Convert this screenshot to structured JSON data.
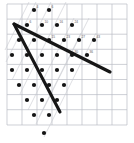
{
  "figure": {
    "width": 134,
    "height": 143,
    "background_color": "#ffffff"
  },
  "chart_data": {
    "type": "scatter",
    "title": "",
    "subtitle": "",
    "xlabel": "",
    "ylabel": "",
    "xlim": [
      0,
      134
    ],
    "ylim": [
      143,
      0
    ],
    "grid": true,
    "legend": false,
    "legend_position": "none",
    "colors": {
      "grid": "#b9bcc4",
      "guide_line": "#c7cad0",
      "ray": "#161616",
      "dot": "#141414",
      "label": "#5a5d63"
    },
    "grid_spec": {
      "x0": 7,
      "y0": 4,
      "x1": 127,
      "y1": 125,
      "cell_width": 15,
      "cell_height": 15.1,
      "vertical_lines": [
        7,
        22,
        37,
        52,
        67,
        82,
        97,
        112,
        127
      ],
      "horizontal_lines": [
        4,
        19.1,
        34.2,
        49.3,
        64.4,
        79.5,
        94.6,
        109.7,
        125
      ]
    },
    "lattice": {
      "basis_u": [
        15.0,
        0.0
      ],
      "basis_v": [
        -7.4,
        15.1
      ],
      "dot_radius": 2.1,
      "note": "Dot rows step left as they descend, producing the sheared arrangement."
    },
    "points": [
      {
        "id": 1,
        "x": 34,
        "y": 10,
        "label": "4"
      },
      {
        "id": 2,
        "x": 49,
        "y": 10,
        "label": "6"
      },
      {
        "id": 3,
        "x": 27,
        "y": 25,
        "label": "6"
      },
      {
        "id": 4,
        "x": 42,
        "y": 25,
        "label": "10"
      },
      {
        "id": 5,
        "x": 57,
        "y": 25,
        "label": "16"
      },
      {
        "id": 6,
        "x": 72,
        "y": 25,
        "label": "24"
      },
      {
        "id": 7,
        "x": 19,
        "y": 40,
        "label": ""
      },
      {
        "id": 8,
        "x": 34,
        "y": 40,
        "label": ""
      },
      {
        "id": 9,
        "x": 49,
        "y": 40,
        "label": "15"
      },
      {
        "id": 10,
        "x": 64,
        "y": 40,
        "label": "23"
      },
      {
        "id": 11,
        "x": 79,
        "y": 40,
        "label": "27"
      },
      {
        "id": 12,
        "x": 94,
        "y": 40,
        "label": "43"
      },
      {
        "id": 13,
        "x": 12,
        "y": 55,
        "label": ""
      },
      {
        "id": 14,
        "x": 27,
        "y": 55,
        "label": ""
      },
      {
        "id": 15,
        "x": 42,
        "y": 55,
        "label": ""
      },
      {
        "id": 16,
        "x": 57,
        "y": 55,
        "label": ""
      },
      {
        "id": 17,
        "x": 72,
        "y": 55,
        "label": "30"
      },
      {
        "id": 18,
        "x": 87,
        "y": 55,
        "label": "36"
      },
      {
        "id": 19,
        "x": 12,
        "y": 70,
        "label": ""
      },
      {
        "id": 20,
        "x": 27,
        "y": 70,
        "label": ""
      },
      {
        "id": 21,
        "x": 42,
        "y": 70,
        "label": ""
      },
      {
        "id": 22,
        "x": 57,
        "y": 70,
        "label": ""
      },
      {
        "id": 23,
        "x": 72,
        "y": 70,
        "label": ""
      },
      {
        "id": 24,
        "x": 19,
        "y": 85,
        "label": ""
      },
      {
        "id": 25,
        "x": 34,
        "y": 85,
        "label": ""
      },
      {
        "id": 26,
        "x": 49,
        "y": 85,
        "label": ""
      },
      {
        "id": 27,
        "x": 64,
        "y": 85,
        "label": ""
      },
      {
        "id": 28,
        "x": 27,
        "y": 100,
        "label": ""
      },
      {
        "id": 29,
        "x": 42,
        "y": 100,
        "label": ""
      },
      {
        "id": 30,
        "x": 57,
        "y": 100,
        "label": ""
      },
      {
        "id": 31,
        "x": 34,
        "y": 115,
        "label": ""
      },
      {
        "id": 32,
        "x": 49,
        "y": 115,
        "label": ""
      },
      {
        "id": 33,
        "x": 44,
        "y": 133,
        "label": ""
      }
    ],
    "guide_lines": [
      {
        "id": "g1",
        "x1": 36,
        "y1": 2,
        "x2": 6,
        "y2": 62
      },
      {
        "id": "g2",
        "x1": 51,
        "y1": 2,
        "x2": 12,
        "y2": 80
      },
      {
        "id": "g3",
        "x1": 66,
        "y1": 2,
        "x2": 20,
        "y2": 94
      },
      {
        "id": "g4",
        "x1": 74,
        "y1": 18,
        "x2": 28,
        "y2": 110
      },
      {
        "id": "g5",
        "x1": 89,
        "y1": 18,
        "x2": 36,
        "y2": 124
      },
      {
        "id": "g6",
        "x1": 96,
        "y1": 33,
        "x2": 44,
        "y2": 137
      },
      {
        "id": "g7",
        "x1": 29,
        "y1": 2,
        "x2": 5,
        "y2": 50
      },
      {
        "id": "g8",
        "x1": 81,
        "y1": 33,
        "x2": 39,
        "y2": 117
      }
    ],
    "cone": {
      "apex": [
        14,
        24
      ],
      "rays": [
        {
          "id": "ray-upper",
          "from": [
            14,
            24
          ],
          "to": [
            110,
            72
          ],
          "label": ""
        },
        {
          "id": "ray-lower",
          "from": [
            14,
            24
          ],
          "to": [
            60,
            112
          ],
          "label": ""
        }
      ]
    }
  }
}
